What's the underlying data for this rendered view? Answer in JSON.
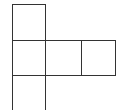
{
  "diagram": {
    "type": "cube-net-partial",
    "line_color": "#333333",
    "background": "#ffffff",
    "squares": [
      {
        "id": "top",
        "x": 12,
        "y": 4,
        "w": 34,
        "h": 37
      },
      {
        "id": "middle-left",
        "x": 12,
        "y": 40,
        "w": 34,
        "h": 36
      },
      {
        "id": "middle-center",
        "x": 45,
        "y": 40,
        "w": 37,
        "h": 36
      },
      {
        "id": "middle-right",
        "x": 81,
        "y": 40,
        "w": 35,
        "h": 36
      },
      {
        "id": "bottom",
        "x": 12,
        "y": 75,
        "w": 34,
        "h": 40
      }
    ]
  }
}
